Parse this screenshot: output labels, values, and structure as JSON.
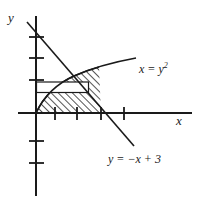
{
  "figure": {
    "kind": "cartesian-sketch",
    "axes": {
      "x_label": "x",
      "y_label": "y",
      "x_axis": {
        "y_px": 113,
        "x_start": 36,
        "x_end": 192
      },
      "y_axis": {
        "x_px": 36,
        "y_start": 16,
        "y_end": 196
      },
      "x_ticks_px": [
        55,
        77,
        101,
        124
      ],
      "y_ticks_px": [
        37,
        58,
        80,
        141,
        163
      ]
    },
    "curves": [
      {
        "name": "parabola",
        "label": "x = y",
        "label_exponent": "2",
        "equation": "x = y^2",
        "description": "rightward-opening parabola through the origin, rising to the right"
      },
      {
        "name": "line",
        "label": "y = −x + 3",
        "equation": "y = -x + 3",
        "description": "descending straight line crossing the x-axis at x = 3"
      }
    ],
    "regions": [
      {
        "name": "hatched-region",
        "fill": "diagonal-hatch",
        "description": "area bounded by the parabola, the line and the x-axis"
      },
      {
        "name": "representative-rectangle",
        "fill": "white",
        "description": "unshaded horizontal strip drawn inside the region"
      }
    ],
    "colors": {
      "ink": "#1a1a1a",
      "background": "#ffffff",
      "hatch": "#1a1a1a"
    }
  }
}
